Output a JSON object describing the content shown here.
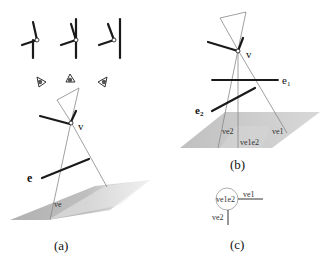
{
  "figure": {
    "panels": [
      {
        "id": "a",
        "caption": "(a)",
        "labels": {
          "vertex": "v",
          "edge": "e",
          "region": "ve"
        }
      },
      {
        "id": "b",
        "caption": "(b)",
        "labels": {
          "vertex": "v",
          "edge1": "e1",
          "edge2": "e2",
          "region_ve2": "ve2",
          "region_ve1e2": "ve1e2",
          "region_ve1": "ve1"
        }
      },
      {
        "id": "c",
        "caption": "(c)",
        "labels": {
          "node": "ve1e2",
          "branch1": "ve1",
          "branch2": "ve2"
        }
      }
    ],
    "colors": {
      "line": "#1a1a1a",
      "thin": "#888888",
      "shade": "#b0b0b0"
    }
  }
}
